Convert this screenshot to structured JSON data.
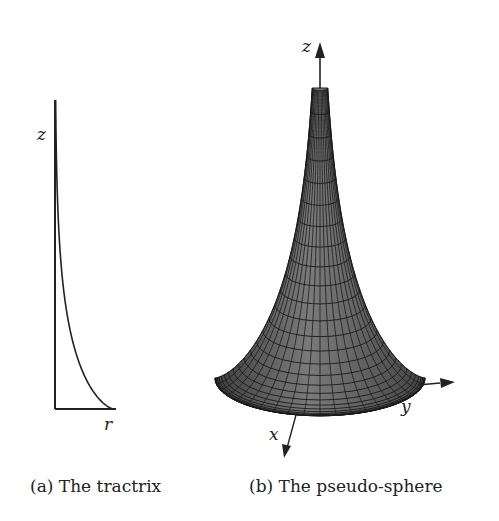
{
  "figure": {
    "subfigure_a": {
      "caption": "(a) The tractrix",
      "axis_labels": {
        "vertical": "z",
        "horizontal": "r"
      },
      "curve": "tractrix"
    },
    "subfigure_b": {
      "caption": "(b) The pseudo-sphere",
      "axis_labels": {
        "z": "z",
        "x": "x",
        "y": "y"
      },
      "surface": "pseudo-sphere"
    }
  },
  "colors": {
    "line": "#222222",
    "surface_fill": "#6b6b6b",
    "surface_grid": "#1a1a1a",
    "background": "#ffffff"
  }
}
